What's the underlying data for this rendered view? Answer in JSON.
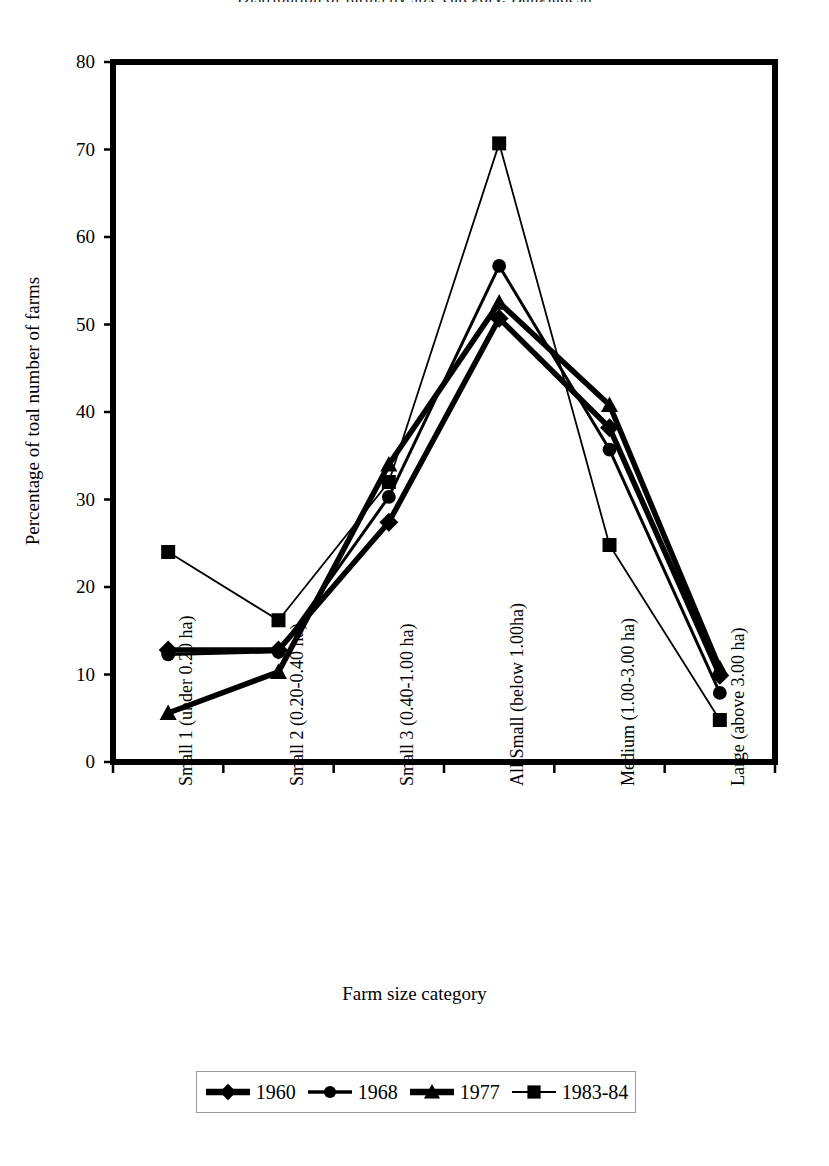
{
  "chart_data": {
    "type": "line",
    "title": "Distribution of farms by size category, Bangladesh",
    "xlabel": "Farm size category",
    "ylabel": "Percentage of toal number of farms",
    "ylim": [
      0,
      80
    ],
    "ytick_labels": [
      "0",
      "10",
      "20",
      "30",
      "40",
      "50",
      "60",
      "70",
      "80"
    ],
    "yticks": [
      0,
      10,
      20,
      30,
      40,
      50,
      60,
      70,
      80
    ],
    "grid": false,
    "legend_position": "bottom",
    "categories": [
      "Small 1 (under 0.20 ha)",
      "Small 2 (0.20-0.40 ha)",
      "Small 3 (0.40-1.00 ha)",
      "All Small (below 1.00ha)",
      "Medium (1.00-3.00 ha)",
      "Large (above 3.00 ha)"
    ],
    "series": [
      {
        "name": "1960",
        "marker": "diamond",
        "values": [
          12.8,
          12.8,
          27.4,
          50.7,
          38.2,
          9.9
        ]
      },
      {
        "name": "1968",
        "marker": "circle",
        "values": [
          12.3,
          12.6,
          30.3,
          56.7,
          35.7,
          7.9
        ]
      },
      {
        "name": "1977",
        "marker": "triangle",
        "values": [
          5.6,
          10.3,
          34.0,
          52.5,
          40.8,
          10.7
        ]
      },
      {
        "name": "1983-84",
        "marker": "square",
        "values": [
          24.0,
          16.2,
          32.0,
          70.7,
          24.8,
          4.8
        ]
      }
    ]
  },
  "colors": {
    "ink": "#000000",
    "axis": "#000000",
    "background": "#ffffff",
    "legend_border": "#999999"
  },
  "legend": {
    "entries": [
      {
        "label": "1960",
        "marker": "diamond"
      },
      {
        "label": "1968",
        "marker": "circle"
      },
      {
        "label": "1977",
        "marker": "triangle"
      },
      {
        "label": "1983-84",
        "marker": "square"
      }
    ]
  }
}
